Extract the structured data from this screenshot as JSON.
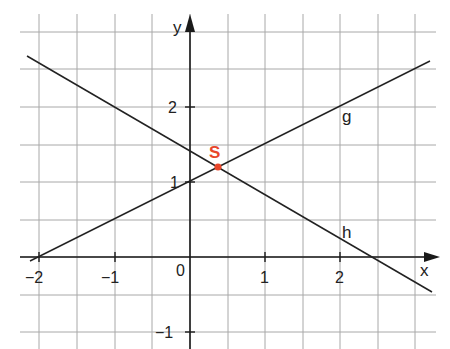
{
  "chart_data": {
    "type": "line",
    "title": "",
    "xlabel": "x",
    "ylabel": "y",
    "xlim": [
      -2.27,
      3.2
    ],
    "ylim": [
      -1.23,
      3.25
    ],
    "grid": true,
    "grid_step": 0.5,
    "x_ticks": [
      -2,
      -1,
      0,
      1,
      2
    ],
    "x_tick_labels": [
      "−2",
      "−1",
      "0",
      "1",
      "2"
    ],
    "y_ticks": [
      -1,
      1,
      2
    ],
    "y_tick_labels": [
      "−1",
      "1",
      "2"
    ],
    "origin_label": "0",
    "series": [
      {
        "name": "g",
        "equation": "y = 0.5x + 1",
        "x": [
          -2.1,
          3.2
        ],
        "y": [
          -0.05,
          2.6
        ],
        "color": "#222222"
      },
      {
        "name": "h",
        "equation": "y = -0.58x + 1.4",
        "x": [
          -2.2,
          3.2
        ],
        "y": [
          2.68,
          -0.47
        ],
        "color": "#222222"
      }
    ],
    "annotations": [
      {
        "label": "S",
        "x": 0.37,
        "y": 1.19,
        "color": "#e8462a",
        "type": "point"
      },
      {
        "label": "g",
        "x": 2.1,
        "y": 1.85
      },
      {
        "label": "h",
        "x": 2.05,
        "y": 0.33
      }
    ]
  },
  "labels": {
    "x_axis": "x",
    "y_axis": "y",
    "line_g": "g",
    "line_h": "h",
    "point_s": "S",
    "origin": "0",
    "x_tick_m2": "−2",
    "x_tick_m1": "−1",
    "x_tick_1": "1",
    "x_tick_2": "2",
    "y_tick_1": "1",
    "y_tick_2": "2",
    "y_tick_m1": "−1"
  },
  "colors": {
    "grid": "#a8a8a8",
    "axis": "#1a1a1a",
    "line": "#222222",
    "point": "#e8462a"
  }
}
